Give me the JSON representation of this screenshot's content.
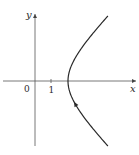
{
  "figure": {
    "axes": {
      "x_label": "x",
      "y_label": "y",
      "origin_label": "0",
      "x_tick_label": "1"
    },
    "curve": {
      "type": "hyperbola-right-branch",
      "vertex_x_units": 2,
      "direction": "upward (from lower-right toward vertex, then upper-right)",
      "arrow_location": "lower branch"
    },
    "colors": {
      "axis": "#555555",
      "curve": "#2a2a2a",
      "background": "#ffffff"
    }
  }
}
